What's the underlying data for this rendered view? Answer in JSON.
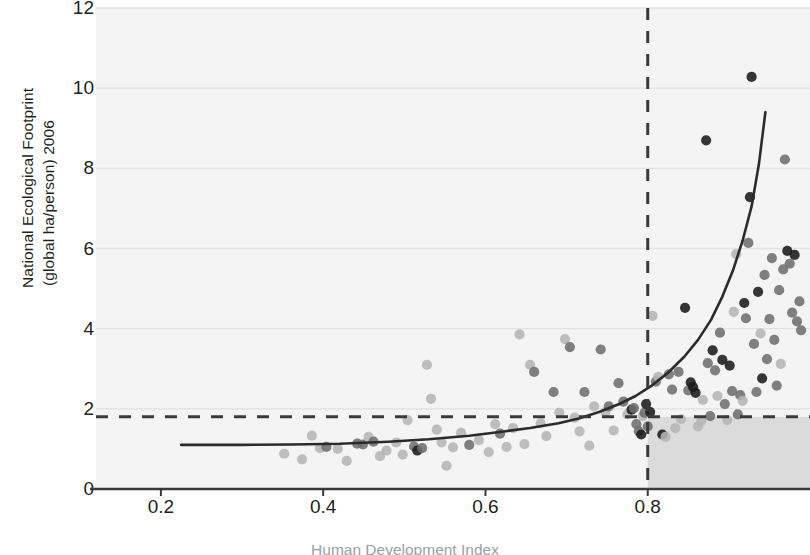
{
  "chart_data": {
    "type": "scatter",
    "title": "",
    "ylabel_line1": "National Ecological Footprint",
    "ylabel_line2": "(global ha/person) 2006",
    "xlabel": "Human Development Index",
    "xlim": [
      0.12,
      1.0
    ],
    "ylim": [
      0,
      12
    ],
    "xticks": [
      0.2,
      0.4,
      0.6,
      0.8
    ],
    "xticklabels": [
      "0.2",
      "0.4",
      "0.6",
      "0.8"
    ],
    "yticks": [
      0,
      2,
      4,
      6,
      8,
      10,
      12
    ],
    "yticklabels": [
      "0",
      "2",
      "4",
      "6",
      "8",
      "10",
      "12"
    ],
    "grid": "horizontal",
    "legend": "none",
    "colors": {
      "grid": "#e2e2e2",
      "axis": "#3a3a3a",
      "trend": "#2b2b2b",
      "threshold": "#3a3a3a",
      "plot_background": "#f4f4f4",
      "sustainable_quadrant": "#d9d9d9",
      "point_dark": "#1a1a1a",
      "point_mid": "#6e6e6e",
      "point_light": "#b5b5b5"
    },
    "annotations": [
      {
        "name": "biocapacity-threshold",
        "type": "hline",
        "y": 1.8,
        "style": "dashed",
        "label": ""
      },
      {
        "name": "hdi-threshold",
        "type": "vline",
        "x": 0.8,
        "style": "dashed",
        "label": ""
      },
      {
        "name": "sustainable-development-quadrant",
        "type": "rect",
        "x0": 0.8,
        "x1": 1.0,
        "y0": 0.0,
        "y1": 1.8,
        "shade": "dark"
      }
    ],
    "trend": {
      "name": "fitted-exponential-trend",
      "type": "line",
      "x": [
        0.225,
        0.3,
        0.36,
        0.42,
        0.48,
        0.53,
        0.58,
        0.62,
        0.655,
        0.69,
        0.715,
        0.74,
        0.765,
        0.785,
        0.805,
        0.825,
        0.845,
        0.862,
        0.878,
        0.892,
        0.905,
        0.917,
        0.928,
        0.937,
        0.945
      ],
      "y": [
        1.1,
        1.1,
        1.11,
        1.13,
        1.18,
        1.24,
        1.33,
        1.43,
        1.52,
        1.64,
        1.76,
        1.92,
        2.12,
        2.32,
        2.58,
        2.9,
        3.3,
        3.72,
        4.22,
        4.8,
        5.45,
        6.2,
        7.05,
        8.1,
        9.4
      ]
    },
    "points": [
      {
        "x": 0.352,
        "y": 0.88,
        "shade": "light"
      },
      {
        "x": 0.374,
        "y": 0.74,
        "shade": "light"
      },
      {
        "x": 0.386,
        "y": 1.33,
        "shade": "light"
      },
      {
        "x": 0.396,
        "y": 1.02,
        "shade": "light"
      },
      {
        "x": 0.404,
        "y": 1.05,
        "shade": "mid"
      },
      {
        "x": 0.418,
        "y": 1.0,
        "shade": "light"
      },
      {
        "x": 0.429,
        "y": 0.7,
        "shade": "light"
      },
      {
        "x": 0.442,
        "y": 1.13,
        "shade": "mid"
      },
      {
        "x": 0.449,
        "y": 1.11,
        "shade": "mid"
      },
      {
        "x": 0.456,
        "y": 1.3,
        "shade": "light"
      },
      {
        "x": 0.462,
        "y": 1.18,
        "shade": "mid"
      },
      {
        "x": 0.47,
        "y": 0.82,
        "shade": "light"
      },
      {
        "x": 0.478,
        "y": 0.96,
        "shade": "light"
      },
      {
        "x": 0.49,
        "y": 1.16,
        "shade": "light"
      },
      {
        "x": 0.498,
        "y": 0.86,
        "shade": "light"
      },
      {
        "x": 0.504,
        "y": 1.72,
        "shade": "light"
      },
      {
        "x": 0.512,
        "y": 1.06,
        "shade": "mid"
      },
      {
        "x": 0.516,
        "y": 0.96,
        "shade": "dark"
      },
      {
        "x": 0.522,
        "y": 1.02,
        "shade": "mid"
      },
      {
        "x": 0.528,
        "y": 3.1,
        "shade": "light"
      },
      {
        "x": 0.533,
        "y": 2.25,
        "shade": "light"
      },
      {
        "x": 0.54,
        "y": 1.48,
        "shade": "light"
      },
      {
        "x": 0.546,
        "y": 1.16,
        "shade": "light"
      },
      {
        "x": 0.552,
        "y": 0.58,
        "shade": "light"
      },
      {
        "x": 0.56,
        "y": 1.04,
        "shade": "light"
      },
      {
        "x": 0.57,
        "y": 1.4,
        "shade": "light"
      },
      {
        "x": 0.58,
        "y": 1.1,
        "shade": "mid"
      },
      {
        "x": 0.592,
        "y": 1.22,
        "shade": "light"
      },
      {
        "x": 0.604,
        "y": 0.92,
        "shade": "light"
      },
      {
        "x": 0.612,
        "y": 1.62,
        "shade": "light"
      },
      {
        "x": 0.618,
        "y": 1.38,
        "shade": "mid"
      },
      {
        "x": 0.626,
        "y": 1.05,
        "shade": "light"
      },
      {
        "x": 0.634,
        "y": 1.52,
        "shade": "light"
      },
      {
        "x": 0.642,
        "y": 3.86,
        "shade": "light"
      },
      {
        "x": 0.648,
        "y": 1.12,
        "shade": "light"
      },
      {
        "x": 0.655,
        "y": 3.1,
        "shade": "light"
      },
      {
        "x": 0.66,
        "y": 2.92,
        "shade": "mid"
      },
      {
        "x": 0.668,
        "y": 1.64,
        "shade": "light"
      },
      {
        "x": 0.675,
        "y": 1.32,
        "shade": "light"
      },
      {
        "x": 0.684,
        "y": 2.42,
        "shade": "mid"
      },
      {
        "x": 0.691,
        "y": 1.9,
        "shade": "light"
      },
      {
        "x": 0.698,
        "y": 3.74,
        "shade": "light"
      },
      {
        "x": 0.704,
        "y": 3.54,
        "shade": "mid"
      },
      {
        "x": 0.71,
        "y": 1.78,
        "shade": "light"
      },
      {
        "x": 0.716,
        "y": 1.44,
        "shade": "light"
      },
      {
        "x": 0.722,
        "y": 2.42,
        "shade": "mid"
      },
      {
        "x": 0.728,
        "y": 1.08,
        "shade": "light"
      },
      {
        "x": 0.734,
        "y": 2.06,
        "shade": "light"
      },
      {
        "x": 0.742,
        "y": 3.48,
        "shade": "mid"
      },
      {
        "x": 0.748,
        "y": 1.92,
        "shade": "light"
      },
      {
        "x": 0.752,
        "y": 2.06,
        "shade": "mid"
      },
      {
        "x": 0.758,
        "y": 1.46,
        "shade": "light"
      },
      {
        "x": 0.764,
        "y": 2.64,
        "shade": "mid"
      },
      {
        "x": 0.77,
        "y": 2.18,
        "shade": "mid"
      },
      {
        "x": 0.775,
        "y": 1.86,
        "shade": "light"
      },
      {
        "x": 0.78,
        "y": 1.98,
        "shade": "dark"
      },
      {
        "x": 0.783,
        "y": 2.02,
        "shade": "mid"
      },
      {
        "x": 0.786,
        "y": 1.62,
        "shade": "mid"
      },
      {
        "x": 0.789,
        "y": 1.44,
        "shade": "mid"
      },
      {
        "x": 0.792,
        "y": 1.36,
        "shade": "dark"
      },
      {
        "x": 0.794,
        "y": 1.82,
        "shade": "light"
      },
      {
        "x": 0.796,
        "y": 1.9,
        "shade": "mid"
      },
      {
        "x": 0.798,
        "y": 2.12,
        "shade": "dark"
      },
      {
        "x": 0.8,
        "y": 1.56,
        "shade": "mid"
      },
      {
        "x": 0.803,
        "y": 1.92,
        "shade": "dark"
      },
      {
        "x": 0.806,
        "y": 4.32,
        "shade": "light"
      },
      {
        "x": 0.81,
        "y": 2.68,
        "shade": "mid"
      },
      {
        "x": 0.813,
        "y": 2.8,
        "shade": "light"
      },
      {
        "x": 0.818,
        "y": 1.36,
        "shade": "dark"
      },
      {
        "x": 0.822,
        "y": 1.3,
        "shade": "light"
      },
      {
        "x": 0.826,
        "y": 2.86,
        "shade": "mid"
      },
      {
        "x": 0.83,
        "y": 2.48,
        "shade": "mid"
      },
      {
        "x": 0.834,
        "y": 1.52,
        "shade": "light"
      },
      {
        "x": 0.838,
        "y": 2.92,
        "shade": "mid"
      },
      {
        "x": 0.841,
        "y": 1.74,
        "shade": "light"
      },
      {
        "x": 0.846,
        "y": 4.52,
        "shade": "dark"
      },
      {
        "x": 0.85,
        "y": 2.46,
        "shade": "mid"
      },
      {
        "x": 0.853,
        "y": 2.66,
        "shade": "dark"
      },
      {
        "x": 0.856,
        "y": 2.54,
        "shade": "dark"
      },
      {
        "x": 0.859,
        "y": 2.4,
        "shade": "dark"
      },
      {
        "x": 0.862,
        "y": 1.56,
        "shade": "light"
      },
      {
        "x": 0.866,
        "y": 1.7,
        "shade": "light"
      },
      {
        "x": 0.868,
        "y": 2.22,
        "shade": "light"
      },
      {
        "x": 0.872,
        "y": 8.7,
        "shade": "dark"
      },
      {
        "x": 0.874,
        "y": 3.14,
        "shade": "mid"
      },
      {
        "x": 0.877,
        "y": 1.82,
        "shade": "mid"
      },
      {
        "x": 0.88,
        "y": 3.46,
        "shade": "dark"
      },
      {
        "x": 0.883,
        "y": 2.96,
        "shade": "mid"
      },
      {
        "x": 0.886,
        "y": 2.32,
        "shade": "light"
      },
      {
        "x": 0.889,
        "y": 3.9,
        "shade": "mid"
      },
      {
        "x": 0.892,
        "y": 3.22,
        "shade": "dark"
      },
      {
        "x": 0.895,
        "y": 2.12,
        "shade": "mid"
      },
      {
        "x": 0.898,
        "y": 1.72,
        "shade": "light"
      },
      {
        "x": 0.901,
        "y": 3.08,
        "shade": "dark"
      },
      {
        "x": 0.904,
        "y": 2.44,
        "shade": "mid"
      },
      {
        "x": 0.906,
        "y": 4.42,
        "shade": "light"
      },
      {
        "x": 0.909,
        "y": 5.86,
        "shade": "light"
      },
      {
        "x": 0.911,
        "y": 1.86,
        "shade": "mid"
      },
      {
        "x": 0.914,
        "y": 2.34,
        "shade": "mid"
      },
      {
        "x": 0.917,
        "y": 2.2,
        "shade": "light"
      },
      {
        "x": 0.919,
        "y": 4.64,
        "shade": "dark"
      },
      {
        "x": 0.921,
        "y": 4.26,
        "shade": "mid"
      },
      {
        "x": 0.924,
        "y": 6.14,
        "shade": "mid"
      },
      {
        "x": 0.926,
        "y": 7.28,
        "shade": "dark"
      },
      {
        "x": 0.928,
        "y": 10.28,
        "shade": "dark"
      },
      {
        "x": 0.931,
        "y": 3.62,
        "shade": "mid"
      },
      {
        "x": 0.934,
        "y": 2.42,
        "shade": "mid"
      },
      {
        "x": 0.936,
        "y": 4.92,
        "shade": "dark"
      },
      {
        "x": 0.939,
        "y": 3.88,
        "shade": "light"
      },
      {
        "x": 0.941,
        "y": 2.76,
        "shade": "dark"
      },
      {
        "x": 0.944,
        "y": 5.34,
        "shade": "mid"
      },
      {
        "x": 0.947,
        "y": 3.24,
        "shade": "mid"
      },
      {
        "x": 0.95,
        "y": 4.24,
        "shade": "mid"
      },
      {
        "x": 0.953,
        "y": 5.76,
        "shade": "mid"
      },
      {
        "x": 0.956,
        "y": 3.72,
        "shade": "mid"
      },
      {
        "x": 0.959,
        "y": 2.58,
        "shade": "mid"
      },
      {
        "x": 0.962,
        "y": 4.96,
        "shade": "mid"
      },
      {
        "x": 0.964,
        "y": 3.12,
        "shade": "light"
      },
      {
        "x": 0.967,
        "y": 5.48,
        "shade": "mid"
      },
      {
        "x": 0.969,
        "y": 8.22,
        "shade": "mid"
      },
      {
        "x": 0.972,
        "y": 5.94,
        "shade": "dark"
      },
      {
        "x": 0.975,
        "y": 5.62,
        "shade": "mid"
      },
      {
        "x": 0.978,
        "y": 4.4,
        "shade": "mid"
      },
      {
        "x": 0.981,
        "y": 5.84,
        "shade": "dark"
      },
      {
        "x": 0.984,
        "y": 4.18,
        "shade": "mid"
      },
      {
        "x": 0.987,
        "y": 4.68,
        "shade": "mid"
      },
      {
        "x": 0.989,
        "y": 3.96,
        "shade": "mid"
      }
    ]
  }
}
